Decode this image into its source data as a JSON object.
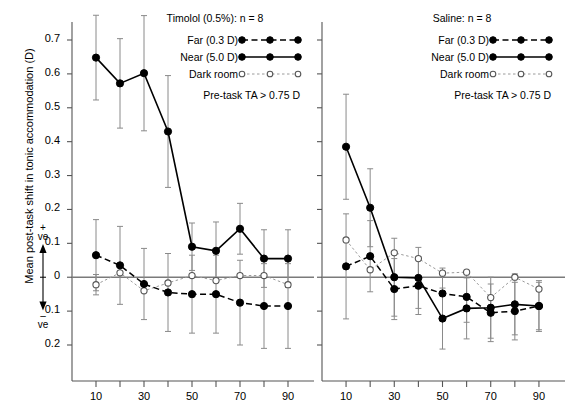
{
  "figure": {
    "y_axis_title": "Mean post-task shift in tonic accommodation (D)",
    "x_axis_title": "Time (s)",
    "positive_marker": "+",
    "positive_unit": "ve",
    "negative_marker": "–",
    "negative_unit": "ve"
  },
  "chart_data": {
    "type": "line",
    "xlabel": "Time (s)",
    "ylabel": "Mean post-task shift in tonic accommodation (D)",
    "xlim": [
      0,
      97
    ],
    "ylim": [
      -0.27,
      0.78
    ],
    "x_major_ticks": [
      10,
      30,
      50,
      70,
      90
    ],
    "x_minor_ticks": [
      20,
      40,
      60,
      80
    ],
    "x_tick_labels": [
      "10",
      "30",
      "50",
      "70",
      "90"
    ],
    "y_ticks": [
      0.7,
      0.6,
      0.5,
      0.4,
      0.3,
      0.2,
      0.1,
      0,
      -0.1,
      -0.2
    ],
    "y_tick_labels": [
      "0.7",
      "0.6",
      "0.5",
      "0.4",
      "0.3",
      "0.2",
      "0.1",
      "0",
      "0.1",
      "0.2"
    ],
    "grid": false,
    "legend_position": "top-right inside each panel",
    "panels": [
      {
        "id": "timolol",
        "title": "Timolol (0.5%): n = 8",
        "title_drug": "Timolol (0.5%)",
        "title_n": "n = 8",
        "note": "Pre-task TA > 0.75 D",
        "x": [
          10,
          20,
          30,
          40,
          50,
          60,
          70,
          80,
          90
        ],
        "series": [
          {
            "name": "Far (0.3 D)",
            "marker": "filled-circle",
            "line": "dashed",
            "values": [
              0.065,
              0.035,
              -0.02,
              -0.045,
              -0.05,
              -0.05,
              -0.075,
              -0.085,
              -0.085
            ],
            "err": [
              0.105,
              0.115,
              0.105,
              0.115,
              0.115,
              0.115,
              0.125,
              0.125,
              0.125
            ]
          },
          {
            "name": "Near (5.0 D)",
            "marker": "filled-circle",
            "line": "solid",
            "values": [
              0.648,
              0.572,
              0.602,
              0.43,
              0.09,
              0.078,
              0.143,
              0.055,
              0.055
            ],
            "err": [
              0.125,
              0.132,
              0.17,
              0.165,
              0.07,
              0.085,
              0.075,
              0.085,
              0.085
            ]
          },
          {
            "name": "Dark room",
            "marker": "open-circle",
            "line": "dotted",
            "values": [
              -0.022,
              0.013,
              -0.04,
              -0.017,
              0.005,
              -0.01,
              0.005,
              0.005,
              -0.022
            ],
            "err": [
              0.03,
              0.0,
              0.0,
              0.0,
              0.0,
              0.0,
              0.0,
              0.0,
              0.0
            ]
          }
        ]
      },
      {
        "id": "saline",
        "title": "Saline: n = 8",
        "title_drug": "Saline",
        "title_n": "n = 8",
        "note": "Pre-task TA > 0.75 D",
        "x": [
          10,
          20,
          30,
          40,
          50,
          60,
          70,
          80,
          90
        ],
        "series": [
          {
            "name": "Far (0.3 D)",
            "marker": "filled-circle",
            "line": "dashed",
            "values": [
              0.032,
              0.062,
              -0.035,
              -0.025,
              -0.048,
              -0.058,
              -0.105,
              -0.1,
              -0.085
            ],
            "err": [
              0.155,
              0.105,
              0.09,
              0.085,
              0.075,
              0.075,
              0.085,
              0.085,
              0.075
            ]
          },
          {
            "name": "Near (5.0 D)",
            "marker": "filled-circle",
            "line": "solid",
            "values": [
              0.385,
              0.205,
              0.0,
              -0.002,
              -0.122,
              -0.092,
              -0.09,
              -0.08,
              -0.085
            ],
            "err": [
              0.155,
              0.115,
              0.115,
              0.09,
              0.09,
              0.09,
              0.09,
              0.09,
              0.07
            ]
          },
          {
            "name": "Dark room",
            "marker": "open-circle",
            "line": "dotted",
            "values": [
              0.11,
              0.022,
              0.072,
              0.055,
              0.012,
              0.015,
              -0.06,
              0.0,
              -0.035
            ],
            "err": [
              0.0,
              0.0,
              0.0,
              0.0,
              0.0,
              0.0,
              0.0,
              0.0,
              0.0
            ]
          }
        ]
      }
    ],
    "legend": [
      {
        "label": "Far (0.3 D)",
        "marker": "filled-circle",
        "line": "dashed"
      },
      {
        "label": "Near (5.0 D)",
        "marker": "filled-circle",
        "line": "solid"
      },
      {
        "label": "Dark room",
        "marker": "open-circle",
        "line": "dotted"
      }
    ],
    "colors": {
      "line": "#000000",
      "errorbar": "#8a8a8a",
      "axis": "#555555",
      "zeroline": "#7a7a7a",
      "background": "#ffffff"
    }
  }
}
